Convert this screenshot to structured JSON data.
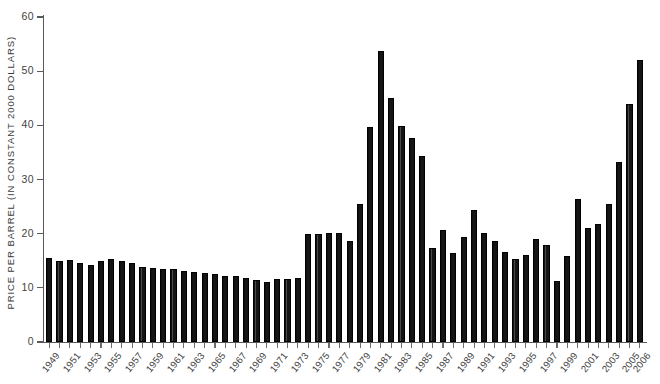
{
  "chart_data": {
    "type": "bar",
    "title": "",
    "subtitle": "",
    "xlabel": "",
    "ylabel": "PRICE PER BARREL (IN CONSTANT 2000 DOLLARS)",
    "ylim": [
      0,
      60
    ],
    "yticks": [
      0,
      10,
      20,
      30,
      40,
      50,
      60
    ],
    "grid": false,
    "legend": null,
    "x_tick_label_rotation": -52,
    "xtick_labels_shown": [
      "1949",
      "1951",
      "1953",
      "1955",
      "1957",
      "1959",
      "1961",
      "1963",
      "1965",
      "1967",
      "1969",
      "1971",
      "1973",
      "1975",
      "1977",
      "1979",
      "1981",
      "1983",
      "1985",
      "1987",
      "1989",
      "1991",
      "1993",
      "1995",
      "1997",
      "1999",
      "2001",
      "2003",
      "2005",
      "2006"
    ],
    "categories": [
      "1949",
      "1950",
      "1951",
      "1952",
      "1953",
      "1954",
      "1955",
      "1956",
      "1957",
      "1958",
      "1959",
      "1960",
      "1961",
      "1962",
      "1963",
      "1964",
      "1965",
      "1966",
      "1967",
      "1968",
      "1969",
      "1970",
      "1971",
      "1972",
      "1973",
      "1974",
      "1975",
      "1976",
      "1977",
      "1978",
      "1979",
      "1980",
      "1981",
      "1982",
      "1983",
      "1984",
      "1985",
      "1986",
      "1987",
      "1988",
      "1989",
      "1990",
      "1991",
      "1992",
      "1993",
      "1994",
      "1995",
      "1996",
      "1997",
      "1998",
      "1999",
      "2000",
      "2001",
      "2002",
      "2003",
      "2004",
      "2005",
      "2006"
    ],
    "values": [
      15.6,
      14.9,
      15.1,
      14.5,
      14.2,
      14.9,
      15.3,
      14.9,
      14.6,
      13.8,
      13.6,
      13.4,
      13.4,
      13.2,
      13.0,
      12.7,
      12.5,
      12.2,
      12.2,
      11.8,
      11.4,
      11.1,
      11.7,
      11.6,
      11.8,
      20.0,
      19.9,
      20.2,
      20.1,
      18.6,
      25.4,
      39.7,
      53.8,
      45.1,
      39.8,
      37.7,
      34.3,
      17.4,
      20.6,
      16.5,
      19.4,
      24.3,
      20.2,
      18.7,
      16.7,
      15.4,
      16.1,
      19.0,
      17.9,
      11.2,
      15.8,
      26.4,
      21.1,
      21.7,
      25.5,
      33.3,
      44.0,
      52.0
    ],
    "units": "constant 2000 US dollars per barrel",
    "bar_color": "#151515",
    "axis_color": "#58595b",
    "background_color": "#ffffff"
  }
}
